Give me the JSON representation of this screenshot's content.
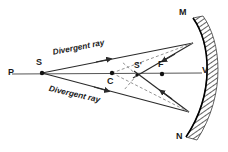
{
  "diagram": {
    "background_color": "#ffffff",
    "ink_color": "#1a1a1a",
    "labels": {
      "pole_left": "P",
      "source": "S",
      "center_of_curvature": "C",
      "image": "S'",
      "focus": "F",
      "vertex": "V",
      "mirror_top": "M",
      "mirror_bottom": "N"
    },
    "ray_labels": {
      "upper": "Divergent ray",
      "lower": "Divergent ray"
    },
    "points": {
      "P": {
        "x": 12,
        "y": 74
      },
      "S": {
        "x": 42,
        "y": 73
      },
      "C": {
        "x": 112,
        "y": 73
      },
      "S_prime": {
        "x": 137,
        "y": 75
      },
      "F": {
        "x": 162,
        "y": 74
      },
      "V": {
        "x": 199,
        "y": 73
      },
      "M_reflect": {
        "x": 193,
        "y": 43
      },
      "N_reflect": {
        "x": 189,
        "y": 112
      }
    },
    "colors": {
      "ray": "#2b2b2b",
      "virtual_ray": "#888888",
      "axis": "#555555",
      "mirror": "#000000",
      "hatch": "#3b3b3b"
    }
  }
}
